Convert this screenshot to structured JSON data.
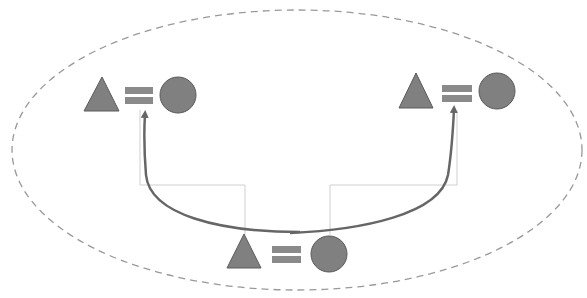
{
  "diagram": {
    "colors": {
      "shape_fill": "#808080",
      "shape_stroke": "#5a5a5a",
      "equals_fill": "#8a8a8a",
      "arrow": "#666666",
      "connector": "#cfcfcf",
      "ellipse_dash": "#999999",
      "background": "#ffffff"
    },
    "groups": [
      {
        "id": "top-left",
        "symbols": [
          "triangle",
          "equals",
          "circle"
        ]
      },
      {
        "id": "top-right",
        "symbols": [
          "triangle",
          "equals",
          "circle"
        ]
      },
      {
        "id": "bottom-center",
        "symbols": [
          "triangle",
          "equals",
          "circle"
        ]
      }
    ],
    "arrows": [
      {
        "from": "bottom-center",
        "to": "top-left"
      },
      {
        "from": "bottom-center",
        "to": "top-right"
      }
    ],
    "container": {
      "shape": "ellipse",
      "style": "dashed"
    }
  }
}
